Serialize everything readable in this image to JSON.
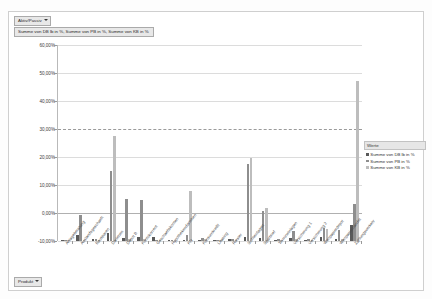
{
  "window": {
    "filter_aktiv_label": "Aktiv/Passiv",
    "series_button_label": "Summe von DB lb in %, Summe von PB in %, Summe von KB in %",
    "filter_produkt_label": "Produkt"
  },
  "legend": {
    "title": "Werte",
    "items": [
      {
        "label": "Summe von DB lb in %",
        "color": "#5a5a5a"
      },
      {
        "label": "Summe von PB in %",
        "color": "#8e8e8e"
      },
      {
        "label": "Summe von KB in %",
        "color": "#bdbdbd"
      }
    ]
  },
  "chart_data": {
    "type": "bar",
    "title": "",
    "xlabel": "",
    "ylabel": "",
    "ylim": [
      -10,
      60
    ],
    "ytick_labels": [
      "60,00%",
      "50,00%",
      "40,00%",
      "30,00%",
      "20,00%",
      "10,00%",
      "0,00%",
      "-10,00%"
    ],
    "ytick_values": [
      60,
      50,
      40,
      30,
      20,
      10,
      0,
      -10
    ],
    "grid": true,
    "legend_position": "right",
    "categories": [
      "Anlageberatung",
      "Auslandsgeschaeft",
      "Bausparen",
      "Darlehen",
      "Depot B",
      "Kontokorrent",
      "Geschaeftskonten",
      "Hypothekendarlehen",
      "Kfz",
      "Konsumkredit",
      "Leasing",
      "Riester",
      "Sichteinlagen",
      "Sparbrief",
      "Termineinlagen",
      "Versicherung 1",
      "Versicherung 2",
      "Wertpapierdepot",
      "Wertpapierhandel",
      "Zahlungsverkehr"
    ],
    "series": [
      {
        "name": "Summe von DB lb in %",
        "color": "#5a5a5a",
        "values": [
          0.3,
          2.0,
          0.6,
          2.8,
          1.0,
          1.5,
          1.4,
          0.3,
          0.4,
          0.5,
          0.2,
          0.6,
          1.3,
          1.2,
          0.5,
          0.9,
          0.4,
          1.4,
          0.8,
          5.8
        ]
      },
      {
        "name": "Summe von PB in %",
        "color": "#8e8e8e",
        "values": [
          0.4,
          9.2,
          0.7,
          25.0,
          15.0,
          14.5,
          0.5,
          0.4,
          2.1,
          1.0,
          0.3,
          0.7,
          27.4,
          10.6,
          0.6,
          3.7,
          0.6,
          4.6,
          4.0,
          13.2
        ]
      },
      {
        "name": "Summe von KB in %",
        "color": "#bdbdbd",
        "values": [
          0.3,
          0.5,
          0.5,
          37.6,
          0.6,
          0.6,
          0.4,
          0.3,
          17.9,
          0.6,
          0.2,
          0.5,
          29.6,
          11.8,
          0.5,
          0.6,
          0.4,
          4.2,
          0.6,
          57.2
        ]
      }
    ]
  }
}
